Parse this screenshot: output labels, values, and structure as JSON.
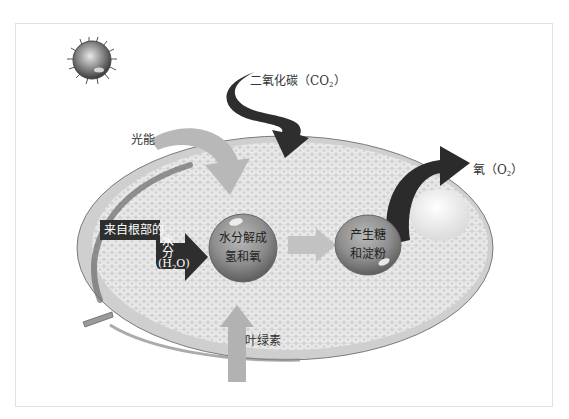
{
  "diagram": {
    "labels": {
      "light_energy": "光能",
      "carbon_dioxide": "二氧化碳",
      "carbon_dioxide_formula_prefix": "（CO",
      "carbon_dioxide_formula_sub": "2",
      "carbon_dioxide_formula_suffix": "）",
      "oxygen": "氧",
      "oxygen_formula_prefix": "（O",
      "oxygen_formula_sub": "2",
      "oxygen_formula_suffix": "）",
      "water_source_line1": "来自根部的",
      "water_source_line2": "水",
      "water_source_line3": "分",
      "water_formula_prefix": "(H",
      "water_formula_sub": "2",
      "water_formula_suffix": "O)",
      "chlorophyll": "叶绿素"
    },
    "bubbles": [
      {
        "line1": "水分解成",
        "line2": "氢和氧"
      },
      {
        "line1": "产生糖",
        "line2": "和淀粉"
      }
    ],
    "icons": {
      "sun": "sun-icon",
      "leaf": "leaf-icon"
    },
    "colors": {
      "dark_arrow": "#2e2e2e",
      "light_arrow": "#b5b5b5",
      "bubble": "#8f8f8f",
      "leaf_surface": "#ececec",
      "leaf_rim": "#6f6f6f",
      "frame_border": "#e2e2e2"
    }
  }
}
